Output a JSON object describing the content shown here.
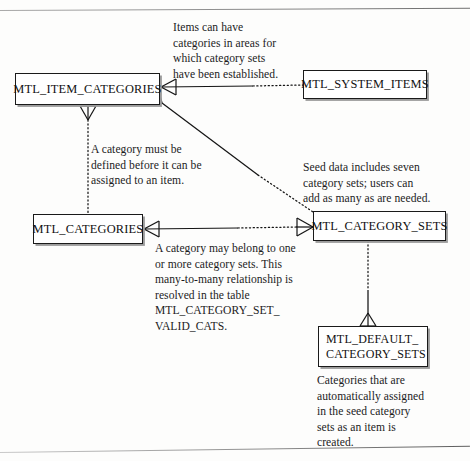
{
  "diagram": {
    "type": "entity-relationship-diagram",
    "title": "",
    "entities": [
      {
        "id": "mtl_item_categories",
        "label": "MTL_ITEM_CATEGORIES"
      },
      {
        "id": "mtl_system_items",
        "label": "MTL_SYSTEM_ITEMS"
      },
      {
        "id": "mtl_categories",
        "label": "MTL_CATEGORIES"
      },
      {
        "id": "mtl_category_sets",
        "label": "MTL_CATEGORY_SETS"
      },
      {
        "id": "mtl_default_category_sets",
        "label_line1": "MTL_DEFAULT_",
        "label_line2": "CATEGORY_SETS"
      }
    ],
    "notes": [
      {
        "id": "items_can_have",
        "text": "Items can have\ncategories in areas for\nwhich category sets\nhave been established."
      },
      {
        "id": "category_defined",
        "text": "A category must be\ndefined before it can be\nassigned to an item."
      },
      {
        "id": "seed_data",
        "text": "Seed data includes seven\ncategory sets; users can\nadd as many as are needed."
      },
      {
        "id": "many_to_many",
        "text": "A category may belong to one\nor more category sets. This\nmany-to-many relationship is\nresolved in the table\nMTL_CATEGORY_SET_\nVALID_CATS."
      },
      {
        "id": "auto_assigned",
        "text": "Categories that are\nautomatically assigned\nin the seed category\nsets as an item is\ncreated."
      }
    ],
    "relationships": [
      {
        "from": "mtl_item_categories",
        "to": "mtl_system_items",
        "line": "solid-to-dotted",
        "from_cardinality": "many",
        "to_cardinality": "one"
      },
      {
        "from": "mtl_item_categories",
        "to": "mtl_categories",
        "line": "dotted",
        "from_cardinality": "many",
        "to_cardinality": "one"
      },
      {
        "from": "mtl_item_categories",
        "to": "mtl_category_sets",
        "line": "solid-to-dotted",
        "from_cardinality": "many",
        "to_cardinality": "many"
      },
      {
        "from": "mtl_categories",
        "to": "mtl_category_sets",
        "line": "solid-to-dotted",
        "from_cardinality": "many",
        "to_cardinality": "many"
      },
      {
        "from": "mtl_category_sets",
        "to": "mtl_default_category_sets",
        "line": "dotted-to-solid",
        "from_cardinality": "one",
        "to_cardinality": "many"
      }
    ]
  },
  "colors": {
    "ink": "#141414",
    "paper": "#fdfdfc",
    "rule": "#8a8a8a"
  }
}
